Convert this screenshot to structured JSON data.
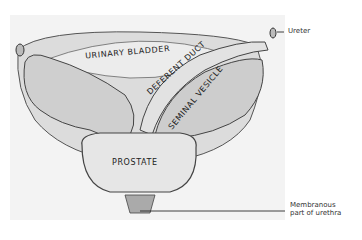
{
  "figure": {
    "labels": {
      "urinary_bladder": "URINARY BLADDER",
      "deferent_duct": "DEFERENT DUCT",
      "seminal_vesicle": "SEMINAL VESICLE",
      "prostate": "PROSTATE"
    },
    "callouts": {
      "ureter": "Ureter",
      "membranous_line1": "Membranous",
      "membranous_line2": "part of urethra"
    }
  }
}
